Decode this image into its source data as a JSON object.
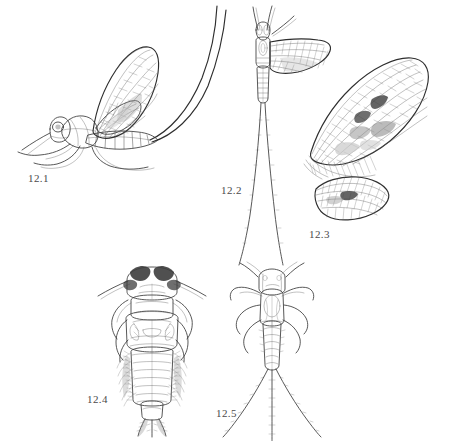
{
  "plate": {
    "title": "Mayfly (Ephemeroptera) identification plate",
    "background_color": "#ffffff",
    "ink_color": "#3a3a3a",
    "label_color": "#4a4a4a"
  },
  "figures": [
    {
      "id": "12.1",
      "label": "12.1",
      "caption": "Adult mayfly, lateral view with two long cerci",
      "view": "lateral",
      "stage": "adult"
    },
    {
      "id": "12.2",
      "label": "12.2",
      "caption": "Adult mayfly, dorsal view with turbinate eyes and two long cerci",
      "view": "dorsal",
      "stage": "adult"
    },
    {
      "id": "12.3",
      "label": "12.3",
      "caption": "Forewing and hindwing venation detail",
      "view": "wing",
      "stage": "adult"
    },
    {
      "id": "12.4",
      "label": "12.4",
      "caption": "Nymph, dorsal view with feathered abdominal gills",
      "view": "dorsal",
      "stage": "nymph"
    },
    {
      "id": "12.5",
      "label": "12.5",
      "caption": "Slender nymph, dorsal view with three caudal filaments",
      "view": "dorsal",
      "stage": "nymph"
    }
  ]
}
